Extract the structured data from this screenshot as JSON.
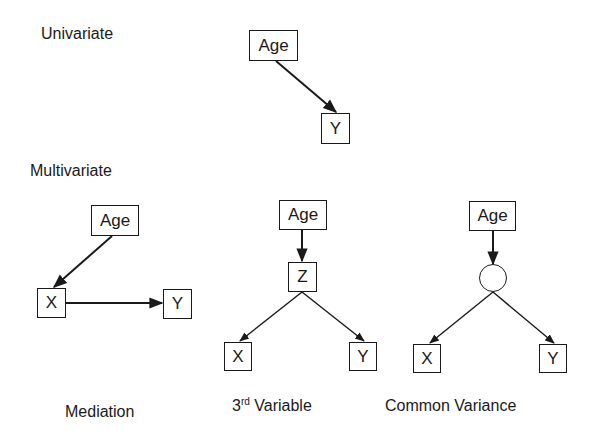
{
  "sections": {
    "univariate": {
      "label": "Univariate"
    },
    "multivariate": {
      "label": "Multivariate"
    }
  },
  "diagrams": {
    "univariate": {
      "nodes": {
        "age": "Age",
        "y": "Y"
      },
      "edges": [
        {
          "from": "Age",
          "to": "Y"
        }
      ]
    },
    "mediation": {
      "caption": "Mediation",
      "nodes": {
        "age": "Age",
        "x": "X",
        "y": "Y"
      },
      "edges": [
        {
          "from": "Age",
          "to": "X"
        },
        {
          "from": "X",
          "to": "Y"
        }
      ]
    },
    "third_variable": {
      "caption_prefix": "3",
      "caption_sup": "rd",
      "caption_suffix": " Variable",
      "nodes": {
        "age": "Age",
        "z": "Z",
        "x": "X",
        "y": "Y"
      },
      "edges": [
        {
          "from": "Age",
          "to": "Z"
        },
        {
          "from": "Z",
          "to": "X"
        },
        {
          "from": "Z",
          "to": "Y"
        }
      ]
    },
    "common_variance": {
      "caption": "Common Variance",
      "nodes": {
        "age": "Age",
        "latent": "",
        "x": "X",
        "y": "Y"
      },
      "edges": [
        {
          "from": "Age",
          "to": "latent"
        },
        {
          "from": "latent",
          "to": "X"
        },
        {
          "from": "latent",
          "to": "Y"
        }
      ]
    }
  },
  "colors": {
    "stroke": "#1a1a1a",
    "background": "#ffffff"
  }
}
